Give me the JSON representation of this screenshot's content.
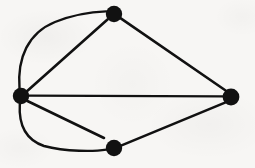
{
  "figure": {
    "kind": "undirected-graph-drawing",
    "caption": "",
    "width": 255,
    "height": 168,
    "background_color": "#f7f6f4",
    "ink_color": "#111111",
    "node_count": 4,
    "edge_count": 7
  },
  "style": {
    "node_fill": "#111111",
    "node_radius": 8,
    "edge_stroke": "#111111",
    "edge_width": 2.6,
    "curve_edge_width": 2.4
  },
  "graph_data": {
    "type": "node-link-diagram",
    "directed": false,
    "has_multi_edges": true,
    "has_dangling_edge": true,
    "nodes": [
      {
        "id": "left",
        "label": "",
        "x": 21,
        "y": 96,
        "r": 8,
        "degree": 5
      },
      {
        "id": "top",
        "label": "",
        "x": 114,
        "y": 14,
        "r": 8,
        "degree": 3
      },
      {
        "id": "right",
        "label": "",
        "x": 231,
        "y": 97,
        "r": 8,
        "degree": 3
      },
      {
        "id": "bottom",
        "label": "",
        "x": 114,
        "y": 148,
        "r": 8,
        "degree": 2
      }
    ],
    "edges": [
      {
        "id": "e1",
        "source": "left",
        "target": "top",
        "shape": "straight",
        "path": "M 27.2 91.0 L 107.5 19.5"
      },
      {
        "id": "e2",
        "source": "left",
        "target": "top",
        "shape": "curved",
        "bulge": "up-left",
        "path": "M 19.5 88.2 C 17.2 58.0 28.0 33.0 55.0 22.0 C 74.0 14.5 94.0 11.8 106.0 11.4"
      },
      {
        "id": "e3",
        "source": "left",
        "target": "right",
        "shape": "straight",
        "path": "M 29.0 95.6 L 223.2 96.3"
      },
      {
        "id": "e4",
        "source": "top",
        "target": "right",
        "shape": "straight",
        "path": "M 120.8 18.4 L 226.0 90.8"
      },
      {
        "id": "e5",
        "source": "bottom",
        "target": "right",
        "shape": "straight",
        "path": "M 121.6 145.4 L 225.0 102.6"
      },
      {
        "id": "e6",
        "source": "left",
        "target": "bottom",
        "shape": "curved",
        "bulge": "down-left",
        "path": "M 19.8 104.0 C 18.6 124.0 25.0 139.5 44.0 146.0 C 66.0 152.0 95.0 151.5 106.4 149.6"
      },
      {
        "id": "e7",
        "source": "left",
        "target": null,
        "shape": "straight",
        "dangling": true,
        "endpoint_x": 104,
        "endpoint_y": 138,
        "path": "M 27.4 101.0 L 104.0 138.0"
      }
    ]
  }
}
